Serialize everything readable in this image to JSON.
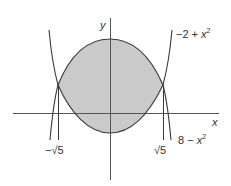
{
  "figure": {
    "type": "region-between-curves",
    "axes": {
      "x_label": "x",
      "y_label": "y"
    },
    "curves": [
      {
        "name": "upper",
        "expr_prefix": "8 − ",
        "expr_var": "x",
        "expr_exp": "2",
        "label": "8 − x²"
      },
      {
        "name": "lower",
        "expr_prefix": "−2 + ",
        "expr_var": "x",
        "expr_exp": "2",
        "label": "−2 + x²"
      }
    ],
    "intersections": {
      "left_label": "−√5",
      "right_label": "√5"
    },
    "colors": {
      "stroke": "#3a3a3a",
      "axis": "#555555",
      "fill": "#cacaca",
      "background": "#ffffff"
    }
  }
}
